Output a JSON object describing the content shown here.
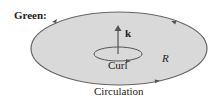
{
  "diagram": {
    "title": "Green:",
    "vector_label": "k",
    "curl_label": "Curl",
    "region_label": "R",
    "boundary_label": "Circulation",
    "colors": {
      "region_fill": "#d9d9d9",
      "boundary_stroke": "#666666",
      "text": "#222222"
    }
  }
}
